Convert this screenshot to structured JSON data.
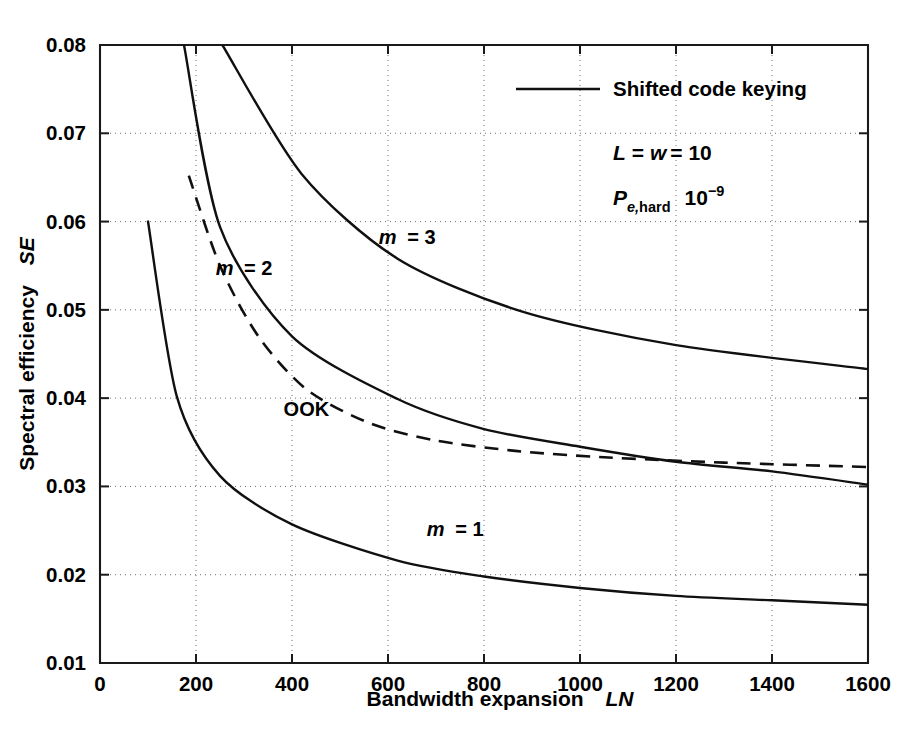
{
  "chart_data": {
    "type": "line",
    "title": "",
    "xlabel": "Bandwidth expansion   LN",
    "xlabel_plain": "Bandwidth expansion",
    "xlabel_italic": "LN",
    "ylabel": "Spectral efficiency  SE",
    "ylabel_plain": "Spectral efficiency",
    "ylabel_italic": "SE",
    "xlim": [
      0,
      1600
    ],
    "ylim": [
      0.01,
      0.08
    ],
    "xticks": [
      0,
      200,
      400,
      600,
      800,
      1000,
      1200,
      1400,
      1600
    ],
    "xticklabels": [
      "0",
      "200",
      "400",
      "600",
      "800",
      "1000",
      "1200",
      "1400",
      "1600"
    ],
    "yticks": [
      0.01,
      0.02,
      0.03,
      0.04,
      0.05,
      0.06,
      0.07,
      0.08
    ],
    "yticklabels": [
      "0.01",
      "0.02",
      "0.03",
      "0.04",
      "0.05",
      "0.06",
      "0.07",
      "0.08"
    ],
    "grid": true,
    "grid_style": "dotted",
    "legend_position": "top-right-inside",
    "legend": [
      {
        "label": "Shifted code keying",
        "style": "solid",
        "color": "#101010"
      }
    ],
    "annotations": [
      {
        "name": "params-L-w",
        "text": "L = w = 10",
        "x": 1030,
        "y": 0.0672
      },
      {
        "name": "params-pe-hard",
        "text": "Pe,hard   10^-9",
        "base": "P",
        "subscript": "e,hard",
        "value": "10",
        "exponent": "-9",
        "x": 1030,
        "y": 0.0605
      }
    ],
    "series": [
      {
        "name": "m = 1",
        "label": "m = 1",
        "label_italic": "m",
        "style": "solid",
        "color": "#101010",
        "label_x": 740,
        "label_y": 0.0244,
        "points": [
          [
            100,
            0.06
          ],
          [
            160,
            0.0402
          ],
          [
            250,
            0.0312
          ],
          [
            400,
            0.0257
          ],
          [
            620,
            0.0216
          ],
          [
            800,
            0.0198
          ],
          [
            1000,
            0.0185
          ],
          [
            1200,
            0.0176
          ],
          [
            1400,
            0.0171
          ],
          [
            1600,
            0.0166
          ]
        ]
      },
      {
        "name": "m = 2",
        "label": "m = 2",
        "label_italic": "m",
        "style": "solid",
        "color": "#101010",
        "label_x": 300,
        "label_y": 0.054,
        "points": [
          [
            175,
            0.08
          ],
          [
            250,
            0.0594
          ],
          [
            400,
            0.047
          ],
          [
            620,
            0.0399
          ],
          [
            800,
            0.0365
          ],
          [
            1000,
            0.0345
          ],
          [
            1200,
            0.0328
          ],
          [
            1400,
            0.0317
          ],
          [
            1600,
            0.0302
          ]
        ]
      },
      {
        "name": "m = 3",
        "label": "m = 3",
        "label_italic": "m",
        "style": "solid",
        "color": "#101010",
        "label_x": 640,
        "label_y": 0.0575,
        "points": [
          [
            255,
            0.08
          ],
          [
            420,
            0.0654
          ],
          [
            620,
            0.0558
          ],
          [
            880,
            0.0498
          ],
          [
            1200,
            0.046
          ],
          [
            1600,
            0.0433
          ]
        ]
      },
      {
        "name": "OOK",
        "label": "OOK",
        "style": "dashed",
        "color": "#101010",
        "label_x": 430,
        "label_y": 0.038,
        "points": [
          [
            185,
            0.0652
          ],
          [
            250,
            0.055
          ],
          [
            330,
            0.047
          ],
          [
            430,
            0.041
          ],
          [
            560,
            0.0372
          ],
          [
            700,
            0.0352
          ],
          [
            870,
            0.034
          ],
          [
            1050,
            0.0333
          ],
          [
            1300,
            0.0327
          ],
          [
            1600,
            0.0322
          ]
        ]
      }
    ]
  },
  "figure": {
    "plot_left_px": 100,
    "plot_right_px": 868,
    "plot_top_px": 45,
    "plot_bottom_px": 663
  }
}
